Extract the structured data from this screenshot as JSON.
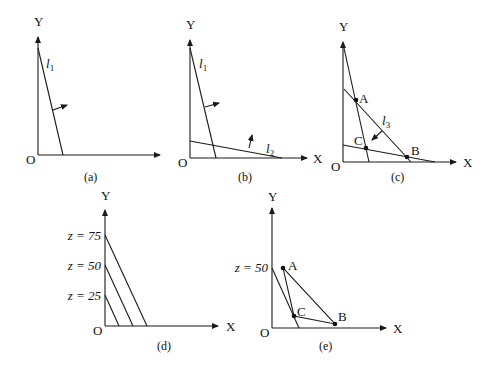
{
  "figure": {
    "panels": [
      {
        "id": "a",
        "caption": "(a)",
        "axis_labels": {
          "x": "",
          "y": "Y",
          "origin": "O"
        },
        "lines": [
          {
            "name": "l",
            "sub": "1"
          }
        ]
      },
      {
        "id": "b",
        "caption": "(b)",
        "axis_labels": {
          "x": "X",
          "y": "Y",
          "origin": "O"
        },
        "lines": [
          {
            "name": "l",
            "sub": "1"
          },
          {
            "name": "l",
            "sub": "2"
          }
        ]
      },
      {
        "id": "c",
        "caption": "(c)",
        "axis_labels": {
          "x": "X",
          "y": "Y",
          "origin": "O"
        },
        "lines": [
          {
            "name": "l",
            "sub": "3"
          }
        ],
        "points": [
          "A",
          "B",
          "C"
        ]
      },
      {
        "id": "d",
        "caption": "(d)",
        "axis_labels": {
          "x": "X",
          "y": "Y",
          "origin": "O"
        },
        "level_labels": [
          "z = 75",
          "z = 50",
          "z = 25"
        ]
      },
      {
        "id": "e",
        "caption": "(e)",
        "axis_labels": {
          "x": "X",
          "y": "Y",
          "origin": "O"
        },
        "level_labels": [
          "z = 50"
        ],
        "points": [
          "A",
          "B",
          "C"
        ]
      }
    ]
  }
}
